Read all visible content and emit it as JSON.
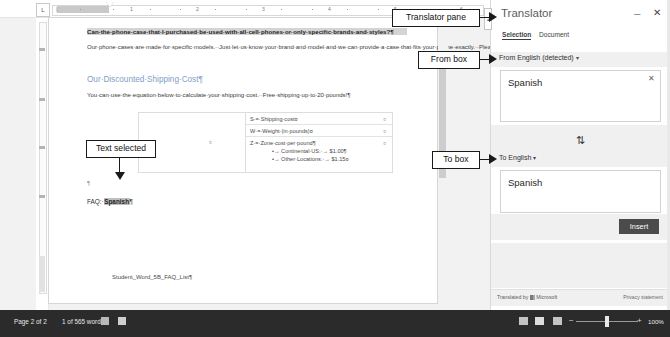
{
  "window": {
    "app": "Microsoft Word",
    "ruler_ticks": [
      "1",
      "2",
      "3",
      "4",
      "5",
      "6"
    ],
    "ruler_corner_icon": "tab-stop-icon"
  },
  "document": {
    "heading": "Can·the·phone·case·that·I·purchased·be·used·with·all·cell·phones·or·only·specific·brands·and·styles?¶",
    "paragraph_1": "Our·phone·cases·are·made·for·specific·models.··Just·let·us·know·your·brand·and·model·and·we·can·provide·a·case·that·fits·your·phone·exactly.··Please·see·our·extensive·online·catalog·to·make·your·selection.¶",
    "subheading": "Our·Discounted·Shipping·Cost¶",
    "paragraph_2": "You·can·use·the·equation·below·to·calculate·your·shipping·cost.··Free·shipping·up·to·20·pounds!¶",
    "table": {
      "left_cell_mark": "¤",
      "rows": [
        {
          "text": "S·=·Shipping·cost¤",
          "end_mark": "¤"
        },
        {
          "text": "W·=·Weight·(in·pounds)¤",
          "end_mark": "¤"
        },
        {
          "text": "Z·=·Zone·cost·per·pound¶",
          "end_mark": "¤"
        }
      ],
      "bullets": [
        "•→ Continental·US:·→ $1.00¶",
        "•→ Other·Locations:·→ $1.15¤"
      ]
    },
    "empty_pilcrow": "¶",
    "faq_line_prefix": "FAQ:·",
    "faq_line_selected": "Spanish",
    "faq_line_suffix": "¶",
    "footer_line": "Student_Word_5B_FAQ_List¶"
  },
  "translator": {
    "title": "Translator",
    "minimize_icon": "minimize-icon",
    "close_icon": "close-icon",
    "tabs": [
      {
        "label": "Selection",
        "active": true
      },
      {
        "label": "Document",
        "active": false
      }
    ],
    "from_label": "From English (detected)",
    "from_caret": "▾",
    "from_text": "Spanish",
    "clear_icon": "clear-x-icon",
    "swap_icon": "swap-languages-icon",
    "swap_glyph": "⇅",
    "to_label": "To English",
    "to_caret": "▾",
    "to_text": "Spanish",
    "insert_label": "Insert",
    "credit_prefix": "Translated by",
    "credit_brand": "Microsoft",
    "privacy_link": "Privacy statement",
    "scroll_tab_glyph": "▴"
  },
  "status_bar": {
    "page_info": "Page 2 of 2",
    "word_count": "1 of 565 words",
    "proofing_icon": "proofing-errors-icon",
    "accessibility_icon": "accessibility-icon",
    "view_read_icon": "read-mode-icon",
    "view_print_icon": "print-layout-icon",
    "view_web_icon": "web-layout-icon",
    "zoom_out_icon": "zoom-out-icon",
    "zoom_in_icon": "zoom-in-icon",
    "zoom_level": "100%"
  },
  "annotations": {
    "translator_pane": "Translator pane",
    "from_box": "From box",
    "to_box": "To box",
    "text_selected": "Text selected"
  }
}
